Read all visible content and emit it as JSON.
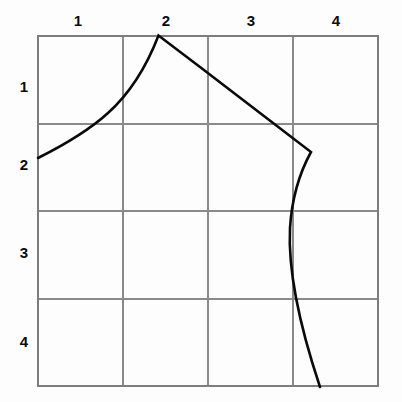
{
  "figure": {
    "title": "",
    "background_color": "#fdfdfd",
    "grid_color": "#8a8a8a",
    "curve_color": "#0a0a0a"
  },
  "grid": {
    "columns": 4,
    "rows": 4,
    "left": 38,
    "top": 36,
    "right": 378,
    "bottom": 386,
    "cell_width": 85,
    "cell_height": 87.5,
    "vertical_lines_x": [
      38,
      123,
      208,
      293,
      378
    ],
    "horizontal_lines_y": [
      36,
      123.5,
      211,
      298.5,
      386
    ]
  },
  "column_labels": [
    {
      "text": "1",
      "x": 78,
      "y": 22
    },
    {
      "text": "2",
      "x": 166,
      "y": 22
    },
    {
      "text": "3",
      "x": 251,
      "y": 22
    },
    {
      "text": "4",
      "x": 336,
      "y": 22
    }
  ],
  "row_labels": [
    {
      "text": "1",
      "x": 24,
      "y": 88
    },
    {
      "text": "2",
      "x": 24,
      "y": 166
    },
    {
      "text": "3",
      "x": 24,
      "y": 254
    },
    {
      "text": "4",
      "x": 24,
      "y": 343
    }
  ],
  "curve": {
    "name": "pattern-outline",
    "stroke_width": 2.6,
    "path": "M 38,158 C 60,147 86,133 108,113 C 128,95 146,68 158.5,35.5 L 200,67 L 260,113 L 311,152 C 300,172 292,196 290,228 C 288,268 297,318 320,387",
    "key_points": [
      {
        "label": "start",
        "x": 38,
        "y": 158
      },
      {
        "label": "apex",
        "x": 158.5,
        "y": 35.5
      },
      {
        "label": "corner",
        "x": 311,
        "y": 152
      },
      {
        "label": "end",
        "x": 320,
        "y": 387
      }
    ]
  }
}
